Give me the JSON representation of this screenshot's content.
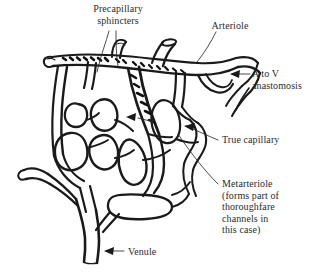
{
  "figure": {
    "type": "anatomical-line-drawing",
    "background_color": "#ffffff",
    "ink_color": "#1a1a1a",
    "text_color": "#2b2b2b"
  },
  "labels": {
    "precapillary_sphincters": "Precapillary\nsphincters",
    "arteriole": "Arteriole",
    "a_to_v_anastomosis": "A to V\nanastomosis",
    "true_capillary": "True capillary",
    "metarteriole": "Metarteriole\n(forms part of\nthoroughfare\nchannels in\nthis case)",
    "venule": "Venule"
  },
  "annotations": [
    {
      "name": "precapillary-sphincters-leader",
      "target": "sphincter bands on arteriole",
      "style": "thin-line",
      "count": 2
    },
    {
      "name": "arteriole-leader",
      "target": "arteriole trunk",
      "style": "thin-line"
    },
    {
      "name": "a-to-v-anastomosis-arrow",
      "target": "shunt vessel between arteriole and venule",
      "style": "arrow",
      "direction": "left"
    },
    {
      "name": "true-capillary-arrow",
      "target": "capillary loop",
      "style": "arrow",
      "direction": "left"
    },
    {
      "name": "metarteriole-leader",
      "target": "metarteriole channel",
      "style": "thin-line"
    },
    {
      "name": "venule-arrow",
      "target": "venule trunk",
      "style": "arrow",
      "direction": "left"
    },
    {
      "name": "inner-capillary-arrow",
      "target": "capillary within network",
      "style": "arrow",
      "direction": "left"
    }
  ]
}
